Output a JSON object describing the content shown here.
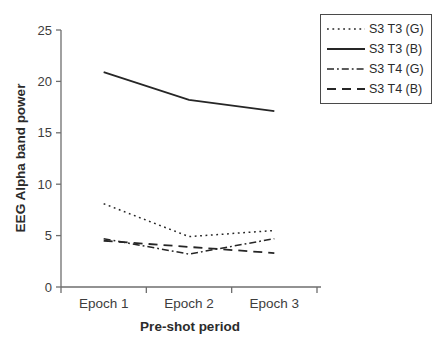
{
  "figure": {
    "background": "#ffffff",
    "line_color": "#262626",
    "axis_color": "#6e6e6e",
    "text_color": "#3d3d3d",
    "legend_border_color": "#4a4a4a"
  },
  "axes": {
    "y_ticks": [
      0,
      5,
      10,
      15,
      20,
      25
    ]
  },
  "legend": {
    "entries": [
      {
        "label": "S3 T3 (G)",
        "style": "dotted"
      },
      {
        "label": "S3 T3 (B)",
        "style": "solid"
      },
      {
        "label": "S3 T4 (G)",
        "style": "dashdot"
      },
      {
        "label": "S3 T4 (B)",
        "style": "dashed"
      }
    ]
  },
  "line_styles": {
    "dotted": {
      "dash": "1.8 3.6",
      "width": 1.5
    },
    "solid": {
      "dash": "",
      "width": 1.8
    },
    "dashdot": {
      "dash": "7 3 1.8 3",
      "width": 1.5
    },
    "dashed": {
      "dash": "9 6",
      "width": 1.8
    }
  },
  "chart_data": {
    "type": "line",
    "categories": [
      "Epoch 1",
      "Epoch 2",
      "Epoch 3"
    ],
    "series": [
      {
        "name": "S3 T3 (G)",
        "style": "dotted",
        "values": [
          8.1,
          4.9,
          5.5
        ]
      },
      {
        "name": "S3 T3 (B)",
        "style": "solid",
        "values": [
          20.9,
          18.2,
          17.1
        ]
      },
      {
        "name": "S3 T4 (G)",
        "style": "dashdot",
        "values": [
          4.7,
          3.2,
          4.7
        ]
      },
      {
        "name": "S3 T4 (B)",
        "style": "dashed",
        "values": [
          4.5,
          3.9,
          3.3
        ]
      }
    ],
    "title": "",
    "xlabel": "Pre-shot period",
    "ylabel": "EEG Alpha band power",
    "ylim": [
      0,
      25
    ],
    "grid": false,
    "legend_position": "top-right"
  }
}
